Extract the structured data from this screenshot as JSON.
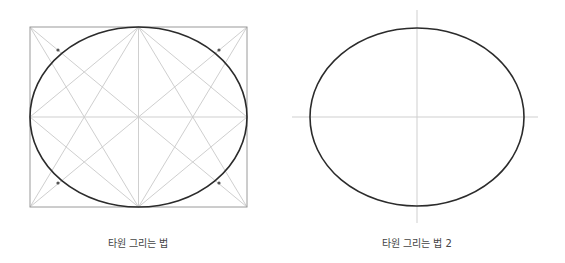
{
  "colors": {
    "background": "#ffffff",
    "ellipse_stroke": "#2b2b2b",
    "guide_stroke": "#c8c8c8",
    "frame_stroke": "#9a9a9a",
    "point_fill": "#555555",
    "caption_text": "#444444"
  },
  "figures": [
    {
      "caption": "타원 그리는 법",
      "frame": {
        "x": 30,
        "y": 27,
        "width": 217,
        "height": 180
      },
      "ellipse": {
        "cx": 138.5,
        "cy": 117,
        "rx": 108.5,
        "ry": 90
      },
      "guide_points": [
        {
          "x": 58,
          "y": 50
        },
        {
          "x": 219,
          "y": 50
        },
        {
          "x": 58,
          "y": 183
        },
        {
          "x": 219,
          "y": 183
        }
      ]
    },
    {
      "caption": "타원 그리는 법 2",
      "ellipse": {
        "cx": 417,
        "cy": 117,
        "rx": 107,
        "ry": 89
      },
      "axes": {
        "horizontal": {
          "x1": 292,
          "x2": 538,
          "y": 117
        },
        "vertical": {
          "y1": 10,
          "y2": 223,
          "x": 417
        }
      }
    }
  ]
}
